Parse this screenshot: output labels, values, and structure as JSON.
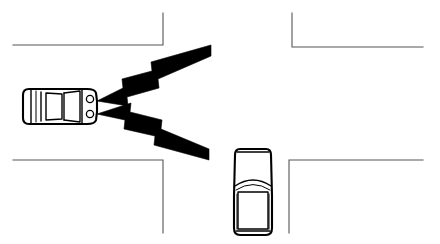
{
  "diagram": {
    "background_color": "#ffffff",
    "line_color": "#555555",
    "ink_color": "#000000",
    "canvas": {
      "width": 440,
      "height": 244
    }
  },
  "roads": {
    "label": "four-way intersection road edges",
    "stroke_color": "#555555",
    "stroke_width": 1.1,
    "corners": [
      {
        "name": "top-left-corner",
        "path": "M 13 45 L 163 45 L 163 13"
      },
      {
        "name": "top-right-corner",
        "path": "M 292 13 L 292 47 L 423 47"
      },
      {
        "name": "bottom-left-corner",
        "path": "M 13 160 L 163 160 L 163 233"
      },
      {
        "name": "bottom-right-corner",
        "path": "M 289 233 L 289 160 L 423 160"
      }
    ]
  },
  "vehicles": [
    {
      "name": "transmitting-car",
      "label": "Car travelling east (top view)",
      "heading": "east",
      "position": {
        "x": 22,
        "y": 87,
        "width": 76,
        "height": 38
      },
      "fill": "#ffffff",
      "stroke": "#000000",
      "has_headlamps": true,
      "headlamp_count": 2
    },
    {
      "name": "approaching-car",
      "label": "Car travelling north (top view)",
      "heading": "north",
      "position": {
        "x": 233,
        "y": 147,
        "width": 40,
        "height": 90
      },
      "fill": "#ffffff",
      "stroke": "#000000",
      "has_headlamps": false,
      "headlamp_count": 0
    }
  ],
  "signals": [
    {
      "name": "upper-signal-bolt",
      "label": "Upper lightning-bolt signal beam",
      "direction": "up-right",
      "origin": {
        "x": 99,
        "y": 102
      },
      "tip": {
        "x": 211,
        "y": 55
      },
      "fill": "#000000",
      "segments": 3
    },
    {
      "name": "lower-signal-bolt",
      "label": "Lower lightning-bolt signal beam",
      "direction": "down-right",
      "origin": {
        "x": 99,
        "y": 113
      },
      "tip": {
        "x": 208,
        "y": 160
      },
      "fill": "#000000",
      "segments": 3
    }
  ]
}
